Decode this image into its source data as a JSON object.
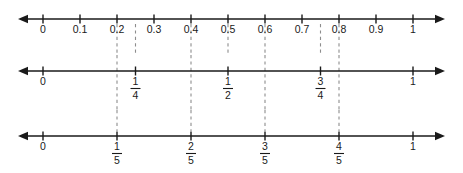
{
  "figure": {
    "background_color": "#ffffff",
    "line_color": "#1a1a1a",
    "dash_color": "#8d8d8d",
    "width": 463,
    "height": 173,
    "axis_start_x": 18,
    "axis_end_x": 445,
    "zero_x": 43,
    "one_x": 413
  },
  "chart_data": {
    "type": "line",
    "xlabel": "",
    "ylabel": "",
    "xlim": [
      0,
      1
    ],
    "grid": false,
    "legend": "none",
    "number_lines": [
      {
        "name": "decimals",
        "axis_y": 19,
        "label_y": 32,
        "ticks": [
          {
            "value": 0,
            "label": "0",
            "type": "decimal"
          },
          {
            "value": 0.1,
            "label": "0.1",
            "type": "decimal"
          },
          {
            "value": 0.2,
            "label": "0.2",
            "type": "decimal"
          },
          {
            "value": 0.3,
            "label": "0.3",
            "type": "decimal"
          },
          {
            "value": 0.4,
            "label": "0.4",
            "type": "decimal"
          },
          {
            "value": 0.5,
            "label": "0.5",
            "type": "decimal"
          },
          {
            "value": 0.6,
            "label": "0.6",
            "type": "decimal"
          },
          {
            "value": 0.7,
            "label": "0.7",
            "type": "decimal"
          },
          {
            "value": 0.8,
            "label": "0.8",
            "type": "decimal"
          },
          {
            "value": 0.9,
            "label": "0.9",
            "type": "decimal"
          },
          {
            "value": 1,
            "label": "1",
            "type": "decimal"
          }
        ],
        "dashed_connectors": [
          {
            "value": 0.2,
            "from_y": 24,
            "to_y": 55
          },
          {
            "value": 0.25,
            "from_y": 24,
            "to_y": 55
          },
          {
            "value": 0.4,
            "from_y": 24,
            "to_y": 55
          },
          {
            "value": 0.5,
            "from_y": 24,
            "to_y": 55
          },
          {
            "value": 0.6,
            "from_y": 24,
            "to_y": 55
          },
          {
            "value": 0.75,
            "from_y": 24,
            "to_y": 55
          },
          {
            "value": 0.8,
            "from_y": 24,
            "to_y": 55
          }
        ]
      },
      {
        "name": "fourths",
        "axis_y": 71,
        "label_y": 84,
        "ticks": [
          {
            "value": 0,
            "label": "0",
            "type": "whole"
          },
          {
            "value": 0.25,
            "numerator": "1",
            "denominator": "4",
            "type": "fraction"
          },
          {
            "value": 0.5,
            "numerator": "1",
            "denominator": "2",
            "type": "fraction"
          },
          {
            "value": 0.75,
            "numerator": "3",
            "denominator": "4",
            "type": "fraction"
          },
          {
            "value": 1,
            "label": "1",
            "type": "whole"
          }
        ],
        "dashed_connectors": [
          {
            "value": 0.2,
            "from_y": 55,
            "to_y": 110
          },
          {
            "value": 0.4,
            "from_y": 55,
            "to_y": 110
          },
          {
            "value": 0.6,
            "from_y": 55,
            "to_y": 110
          },
          {
            "value": 0.8,
            "from_y": 55,
            "to_y": 110
          }
        ]
      },
      {
        "name": "fifths",
        "axis_y": 136,
        "label_y": 149,
        "ticks": [
          {
            "value": 0,
            "label": "0",
            "type": "whole"
          },
          {
            "value": 0.2,
            "numerator": "1",
            "denominator": "5",
            "type": "fraction"
          },
          {
            "value": 0.4,
            "numerator": "2",
            "denominator": "5",
            "type": "fraction"
          },
          {
            "value": 0.6,
            "numerator": "3",
            "denominator": "5",
            "type": "fraction"
          },
          {
            "value": 0.8,
            "numerator": "4",
            "denominator": "5",
            "type": "fraction"
          },
          {
            "value": 1,
            "label": "1",
            "type": "whole"
          }
        ],
        "dashed_connectors": [
          {
            "value": 0.2,
            "from_y": 110,
            "to_y": 131
          },
          {
            "value": 0.4,
            "from_y": 110,
            "to_y": 131
          },
          {
            "value": 0.6,
            "from_y": 110,
            "to_y": 131
          },
          {
            "value": 0.8,
            "from_y": 110,
            "to_y": 131
          }
        ]
      }
    ]
  }
}
